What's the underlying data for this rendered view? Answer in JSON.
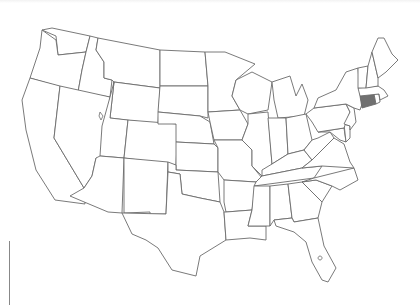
{
  "map": {
    "title": "",
    "region": "Contiguous United States",
    "style": "blank state outline map",
    "colors": {
      "background": "#ffffff",
      "outline": "#6b6b6b",
      "state_fill": "#ffffff",
      "highlight_fill": "#707070"
    },
    "highlighted_states": [
      "Connecticut"
    ],
    "states": [
      "Washington",
      "Oregon",
      "California",
      "Idaho",
      "Nevada",
      "Montana",
      "Wyoming",
      "Utah",
      "Arizona",
      "Colorado",
      "New Mexico",
      "North Dakota",
      "South Dakota",
      "Nebraska",
      "Kansas",
      "Oklahoma",
      "Texas",
      "Minnesota",
      "Iowa",
      "Missouri",
      "Arkansas",
      "Louisiana",
      "Wisconsin",
      "Illinois",
      "Michigan",
      "Indiana",
      "Ohio",
      "Kentucky",
      "Tennessee",
      "Mississippi",
      "Alabama",
      "Georgia",
      "Florida",
      "South Carolina",
      "North Carolina",
      "Virginia",
      "West Virginia",
      "Maryland",
      "Delaware",
      "Pennsylvania",
      "New Jersey",
      "New York",
      "Connecticut",
      "Rhode Island",
      "Massachusetts",
      "Vermont",
      "New Hampshire",
      "Maine"
    ]
  }
}
